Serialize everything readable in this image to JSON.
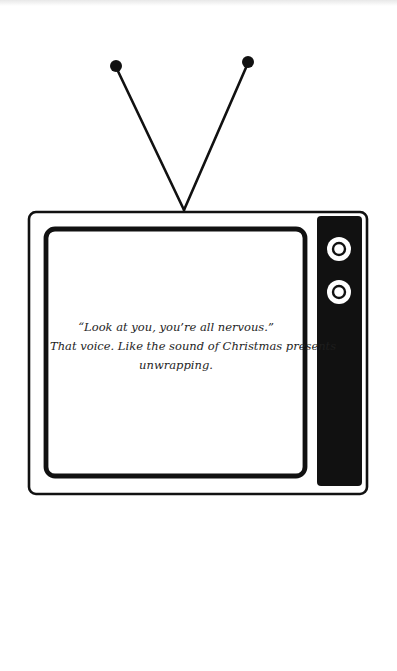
{
  "illustration": {
    "subject": "television",
    "colors": {
      "ink": "#111111",
      "paper": "#ffffff",
      "text": "#1e1e1e"
    },
    "knobs": [
      {
        "name": "knob-top"
      },
      {
        "name": "knob-bottom"
      }
    ]
  },
  "screen": {
    "lines": [
      "“Look at you, you’re all nervous.”",
      "That voice. Like the sound of Christmas presents",
      "unwrapping."
    ]
  }
}
